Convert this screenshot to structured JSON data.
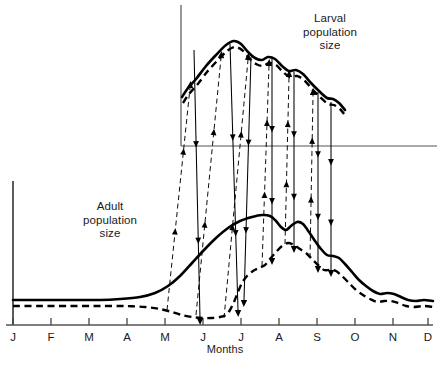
{
  "figure": {
    "type": "scientific-line-diagram",
    "background_color": "#ffffff",
    "line_color": "#000000",
    "axis_color": "#555555"
  },
  "labels": {
    "larval": "Larval\npopulation\nsize",
    "adult": "Adult\npopulation\nsize",
    "x_axis_title": "Months"
  },
  "chart_data": {
    "type": "line",
    "title": "",
    "subtitle": "",
    "xlabel": "Months",
    "ylabel": "",
    "grid": false,
    "legend_position": "inline-annotation",
    "categories": [
      "J",
      "F",
      "M",
      "A",
      "M",
      "J",
      "J",
      "A",
      "S",
      "O",
      "N",
      "D"
    ],
    "xlim": [
      0,
      11
    ],
    "panels": [
      {
        "name": "larval-panel",
        "label": "Larval population size",
        "axis_origin_px": [
          181,
          146
        ],
        "axis_top_px": [
          181,
          5
        ],
        "axis_right_px": [
          437,
          146
        ],
        "series": [
          {
            "name": "larval-solid",
            "style": "solid",
            "width": 2.6,
            "points_px": [
              [
                182,
                97
              ],
              [
                188,
                88
              ],
              [
                196,
                79
              ],
              [
                206,
                66
              ],
              [
                216,
                55
              ],
              [
                226,
                45
              ],
              [
                234,
                41
              ],
              [
                241,
                44
              ],
              [
                248,
                52
              ],
              [
                255,
                58
              ],
              [
                262,
                60
              ],
              [
                268,
                57
              ],
              [
                275,
                59
              ],
              [
                282,
                66
              ],
              [
                289,
                71
              ],
              [
                296,
                70
              ],
              [
                303,
                74
              ],
              [
                311,
                83
              ],
              [
                319,
                91
              ],
              [
                327,
                98
              ],
              [
                333,
                99
              ],
              [
                339,
                103
              ],
              [
                345,
                110
              ]
            ]
          },
          {
            "name": "larval-dashed",
            "style": "dashed",
            "width": 2.4,
            "offset_px": [
              0,
              6
            ],
            "points_px": [
              [
                183,
                103
              ],
              [
                189,
                94
              ],
              [
                197,
                85
              ],
              [
                207,
                72
              ],
              [
                217,
                61
              ],
              [
                227,
                51
              ],
              [
                235,
                47
              ],
              [
                242,
                50
              ],
              [
                249,
                58
              ],
              [
                256,
                64
              ],
              [
                263,
                66
              ],
              [
                269,
                63
              ],
              [
                276,
                65
              ],
              [
                283,
                72
              ],
              [
                290,
                77
              ],
              [
                297,
                76
              ],
              [
                304,
                80
              ],
              [
                312,
                89
              ],
              [
                320,
                97
              ],
              [
                328,
                104
              ],
              [
                334,
                105
              ],
              [
                340,
                109
              ],
              [
                344,
                114
              ]
            ]
          }
        ]
      },
      {
        "name": "adult-panel",
        "label": "Adult population size",
        "axis_origin_px": [
          13,
          325
        ],
        "axis_top_px": [
          13,
          181
        ],
        "axis_right_px": [
          433,
          325
        ],
        "series": [
          {
            "name": "adult-solid",
            "style": "solid",
            "width": 2.6,
            "points_px": [
              [
                13,
                300
              ],
              [
                40,
                300
              ],
              [
                70,
                300
              ],
              [
                100,
                300
              ],
              [
                120,
                299
              ],
              [
                140,
                297
              ],
              [
                155,
                293
              ],
              [
                168,
                286
              ],
              [
                180,
                276
              ],
              [
                192,
                263
              ],
              [
                204,
                250
              ],
              [
                216,
                238
              ],
              [
                228,
                228
              ],
              [
                240,
                221
              ],
              [
                252,
                217
              ],
              [
                262,
                215
              ],
              [
                270,
                216
              ],
              [
                276,
                221
              ],
              [
                281,
                227
              ],
              [
                286,
                230
              ],
              [
                291,
                226
              ],
              [
                297,
                222
              ],
              [
                303,
                224
              ],
              [
                309,
                232
              ],
              [
                315,
                241
              ],
              [
                321,
                249
              ],
              [
                327,
                255
              ],
              [
                333,
                256
              ],
              [
                339,
                258
              ],
              [
                345,
                264
              ],
              [
                352,
                272
              ],
              [
                359,
                280
              ],
              [
                366,
                286
              ],
              [
                373,
                291
              ],
              [
                380,
                294
              ],
              [
                387,
                293
              ],
              [
                394,
                294
              ],
              [
                401,
                297
              ],
              [
                408,
                300
              ],
              [
                416,
                301
              ],
              [
                424,
                300
              ],
              [
                433,
                301
              ]
            ]
          },
          {
            "name": "adult-dashed",
            "style": "dashed",
            "width": 2.4,
            "points_px": [
              [
                13,
                306
              ],
              [
                40,
                306
              ],
              [
                70,
                306
              ],
              [
                100,
                306
              ],
              [
                125,
                306
              ],
              [
                145,
                307
              ],
              [
                160,
                309
              ],
              [
                172,
                312
              ],
              [
                182,
                315
              ],
              [
                192,
                317
              ],
              [
                202,
                318
              ],
              [
                212,
                318
              ],
              [
                220,
                317
              ],
              [
                226,
                315
              ],
              [
                230,
                310
              ],
              [
                234,
                302
              ],
              [
                238,
                292
              ],
              [
                242,
                283
              ],
              [
                247,
                276
              ],
              [
                253,
                271
              ],
              [
                259,
                268
              ],
              [
                265,
                265
              ],
              [
                270,
                259
              ],
              [
                276,
                252
              ],
              [
                282,
                246
              ],
              [
                288,
                243
              ],
              [
                294,
                245
              ],
              [
                300,
                249
              ],
              [
                306,
                253
              ],
              [
                312,
                259
              ],
              [
                318,
                265
              ],
              [
                324,
                270
              ],
              [
                330,
                270
              ],
              [
                336,
                271
              ],
              [
                342,
                276
              ],
              [
                349,
                283
              ],
              [
                356,
                290
              ],
              [
                363,
                295
              ],
              [
                370,
                299
              ],
              [
                377,
                302
              ],
              [
                384,
                301
              ],
              [
                391,
                301
              ],
              [
                398,
                303
              ],
              [
                406,
                306
              ],
              [
                414,
                307
              ],
              [
                424,
                306
              ],
              [
                433,
                307
              ]
            ]
          }
        ]
      }
    ],
    "arrows": {
      "up_dashed": [
        {
          "x1": 167,
          "y1": 310,
          "x2": 190,
          "y2": 88
        },
        {
          "x1": 196,
          "y1": 315,
          "x2": 221,
          "y2": 58
        },
        {
          "x1": 224,
          "y1": 318,
          "x2": 248,
          "y2": 60
        },
        {
          "x1": 262,
          "y1": 266,
          "x2": 269,
          "y2": 66
        },
        {
          "x1": 285,
          "y1": 244,
          "x2": 289,
          "y2": 77
        },
        {
          "x1": 310,
          "y1": 258,
          "x2": 313,
          "y2": 95
        }
      ],
      "down_solid": [
        {
          "x1": 194,
          "y1": 50,
          "x2": 200,
          "y2": 318
        },
        {
          "x1": 230,
          "y1": 44,
          "x2": 238,
          "y2": 310
        },
        {
          "x1": 251,
          "y1": 57,
          "x2": 244,
          "y2": 300
        },
        {
          "x1": 272,
          "y1": 58,
          "x2": 272,
          "y2": 258
        },
        {
          "x1": 294,
          "y1": 72,
          "x2": 294,
          "y2": 246
        },
        {
          "x1": 318,
          "y1": 92,
          "x2": 318,
          "y2": 266
        },
        {
          "x1": 331,
          "y1": 102,
          "x2": 331,
          "y2": 270
        }
      ]
    }
  },
  "x_ticks": [
    {
      "label": "J",
      "x": 13
    },
    {
      "label": "F",
      "x": 51
    },
    {
      "label": "M",
      "x": 89
    },
    {
      "label": "A",
      "x": 127
    },
    {
      "label": "M",
      "x": 165
    },
    {
      "label": "J",
      "x": 203
    },
    {
      "label": "J",
      "x": 241
    },
    {
      "label": "A",
      "x": 279
    },
    {
      "label": "S",
      "x": 317
    },
    {
      "label": "O",
      "x": 355
    },
    {
      "label": "N",
      "x": 393
    },
    {
      "label": "D",
      "x": 428
    }
  ]
}
